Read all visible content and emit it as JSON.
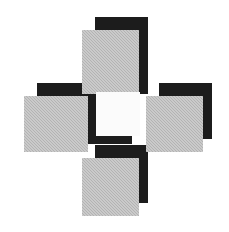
{
  "figure": {
    "canvas": {
      "width": 229,
      "height": 232,
      "background": "#ffffff"
    },
    "palette": {
      "gray_face": "#b3b3b3",
      "black_shadow": "#1c1c1c",
      "white_face": "#fbfbfb",
      "background": "#ffffff"
    },
    "cells": [
      {
        "name": "top-arm",
        "face_color": "gray",
        "face": {
          "x": 82,
          "y": 30,
          "w": 57,
          "h": 64
        },
        "shadow": {
          "x": 95,
          "y": 17,
          "w": 53,
          "h": 77
        },
        "shadow_offset": {
          "dx": 13,
          "dy": -13
        }
      },
      {
        "name": "left-arm",
        "face_color": "gray",
        "face": {
          "x": 24,
          "y": 96,
          "w": 64,
          "h": 56
        },
        "shadow": {
          "x": 37,
          "y": 83,
          "w": 64,
          "h": 56
        },
        "shadow_offset": {
          "dx": 13,
          "dy": -13
        }
      },
      {
        "name": "right-arm",
        "face_color": "gray",
        "face": {
          "x": 146,
          "y": 96,
          "w": 57,
          "h": 56
        },
        "shadow": {
          "x": 159,
          "y": 83,
          "w": 53,
          "h": 56
        },
        "shadow_offset": {
          "dx": 13,
          "dy": -13
        }
      },
      {
        "name": "bottom-arm",
        "face_color": "gray",
        "face": {
          "x": 82,
          "y": 158,
          "w": 57,
          "h": 58
        },
        "shadow": {
          "x": 95,
          "y": 145,
          "w": 53,
          "h": 58
        },
        "shadow_offset": {
          "dx": 13,
          "dy": -13
        }
      },
      {
        "name": "center-square",
        "face_color": "white",
        "face": {
          "x": 96,
          "y": 92,
          "w": 44,
          "h": 44
        },
        "shadow": {
          "x": 88,
          "y": 100,
          "w": 44,
          "h": 44
        },
        "shadow_offset": {
          "dx": -8,
          "dy": 8
        }
      }
    ]
  }
}
